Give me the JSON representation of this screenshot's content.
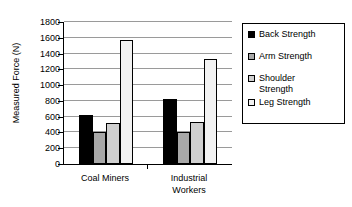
{
  "chart_data": {
    "type": "bar",
    "title": "",
    "subtitle": "",
    "xlabel": "",
    "ylabel": "Measured Force (N)",
    "ylim": [
      0,
      1800
    ],
    "ytick_step": 200,
    "yticks": [
      0,
      200,
      400,
      600,
      800,
      1000,
      1200,
      1400,
      1600,
      1800
    ],
    "grid": "horizontal",
    "legend_position": "right",
    "categories": [
      "Coal Miners",
      "Industrial\nWorkers"
    ],
    "series": [
      {
        "name": "Back Strength",
        "color": "#000000",
        "values": [
          615,
          820
        ]
      },
      {
        "name": "Arm Strength",
        "color": "#a8a8a8",
        "values": [
          410,
          410
        ]
      },
      {
        "name": "Shoulder\nStrength",
        "color": "#d0d0d0",
        "values": [
          525,
          530
        ]
      },
      {
        "name": "Leg Strength",
        "color": "#f2f2f2",
        "values": [
          1575,
          1330
        ]
      }
    ]
  },
  "legend": {
    "items": [
      {
        "label": "Back Strength"
      },
      {
        "label": "Arm Strength"
      },
      {
        "label": "Shoulder\nStrength"
      },
      {
        "label": "Leg Strength"
      }
    ]
  },
  "axes": {
    "y_title": "Measured Force (N)"
  }
}
